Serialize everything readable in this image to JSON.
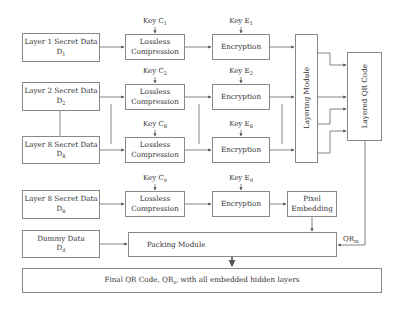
{
  "inputs": [
    {
      "label": "Layer 1 Secret Data",
      "var": "D",
      "sub": "1"
    },
    {
      "label": "Layer 2 Secret Data",
      "var": "D",
      "sub": "2"
    },
    {
      "label": "Layer 8 Secret Data",
      "var": "D",
      "sub": "8"
    },
    {
      "label": "Layer 8 Secret Data",
      "var": "D",
      "sub": "8"
    },
    {
      "label": "Dummy Data",
      "var": "D",
      "sub": "d"
    }
  ],
  "compression": {
    "label_line1": "Lossless",
    "label_line2": "Compression"
  },
  "compression_keys": [
    {
      "text": "Key C",
      "sub": "1"
    },
    {
      "text": "Key C",
      "sub": "2"
    },
    {
      "text": "Key C",
      "sub": "8"
    },
    {
      "text": "Key C",
      "sub": "9"
    }
  ],
  "encryption": {
    "label": "Encryption"
  },
  "encryption_keys": [
    {
      "text": "Key E",
      "sub": "1"
    },
    {
      "text": "Key E",
      "sub": "2"
    },
    {
      "text": "Key E",
      "sub": "8"
    },
    {
      "text": "Key E",
      "sub": "9"
    }
  ],
  "layering_module": {
    "label": "Layering Module"
  },
  "layered_qr": {
    "label": "Layered QR Code"
  },
  "pixel_embedding": {
    "line1": "Pixel",
    "line2": "Embedding"
  },
  "packing_module": {
    "label": "Packing Module"
  },
  "qr_signal": {
    "text": "QR",
    "sub": "m"
  },
  "final_output": {
    "prefix": "Final QR Code, QR",
    "sub": "s",
    "suffix": " with all embedded hidden layers"
  }
}
